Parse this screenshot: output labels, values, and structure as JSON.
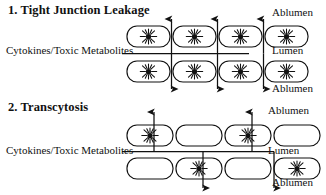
{
  "figure": {
    "background_color": "#ffffff",
    "ink_color": "#111111"
  },
  "panels": [
    {
      "id": "panel-1",
      "heading": "1. Tight Junction Leakage",
      "source_label": "Cytokines/Toxic Metabolites",
      "labels": {
        "top": "Ablumen",
        "middle": "Lumen",
        "bottom": "Ablumen"
      },
      "cells": {
        "top_row": [
          {
            "index": 1,
            "has_nucleus": true
          },
          {
            "index": 2,
            "has_nucleus": true
          },
          {
            "index": 3,
            "has_nucleus": true
          },
          {
            "index": 4,
            "has_nucleus": true
          }
        ],
        "bottom_row": [
          {
            "index": 1,
            "has_nucleus": true
          },
          {
            "index": 2,
            "has_nucleus": true
          },
          {
            "index": 3,
            "has_nucleus": true
          },
          {
            "index": 4,
            "has_nucleus": true
          }
        ]
      },
      "arrows": {
        "description": "paracellular arrows between adjacent cells",
        "direction": "both",
        "count": 3
      }
    },
    {
      "id": "panel-2",
      "heading": "2. Transcytosis",
      "source_label": "Cytokines/Toxic Metabolites",
      "labels": {
        "top": "Ablumen",
        "middle": "Lumen",
        "bottom": "Ablumen"
      },
      "cells": {
        "top_row": [
          {
            "index": 1,
            "has_nucleus": true
          },
          {
            "index": 2,
            "has_nucleus": false
          },
          {
            "index": 3,
            "has_nucleus": true
          },
          {
            "index": 4,
            "has_nucleus": false
          }
        ],
        "bottom_row": [
          {
            "index": 1,
            "has_nucleus": false
          },
          {
            "index": 2,
            "has_nucleus": true
          },
          {
            "index": 3,
            "has_nucleus": false
          },
          {
            "index": 4,
            "has_nucleus": true
          }
        ]
      },
      "arrows": {
        "description": "transcellular arrows passing through cell bodies",
        "direction_up": 2,
        "direction_down": 2,
        "count": 4
      }
    }
  ]
}
